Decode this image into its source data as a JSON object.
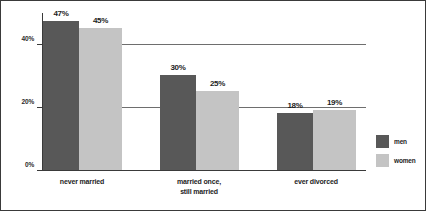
{
  "chart_data": {
    "type": "bar",
    "title": "",
    "subtitle": "",
    "xlabel": "",
    "ylabel": "",
    "categories": [
      "never married",
      "married once,\nstill married",
      "ever divorced"
    ],
    "series": [
      {
        "name": "men",
        "color": "#585858",
        "values": [
          47,
          30,
          18
        ],
        "labels": [
          "47%",
          "30%",
          "18%"
        ]
      },
      {
        "name": "women",
        "color": "#c4c4c4",
        "values": [
          45,
          25,
          19
        ],
        "labels": [
          "45%",
          "25%",
          "19%"
        ]
      }
    ],
    "ylim": [
      0,
      50
    ],
    "yticks": [
      0,
      20,
      40
    ],
    "ytick_labels": [
      "0%",
      "20%",
      "40%"
    ],
    "grid": true,
    "gridlines_at": [
      20,
      40
    ],
    "legend_position": "right"
  },
  "legend": {
    "items": [
      {
        "label": "men",
        "color": "#585858"
      },
      {
        "label": "women",
        "color": "#c4c4c4"
      }
    ]
  },
  "axis": {
    "y_labels": [
      "40%",
      "20%",
      "0%"
    ]
  }
}
